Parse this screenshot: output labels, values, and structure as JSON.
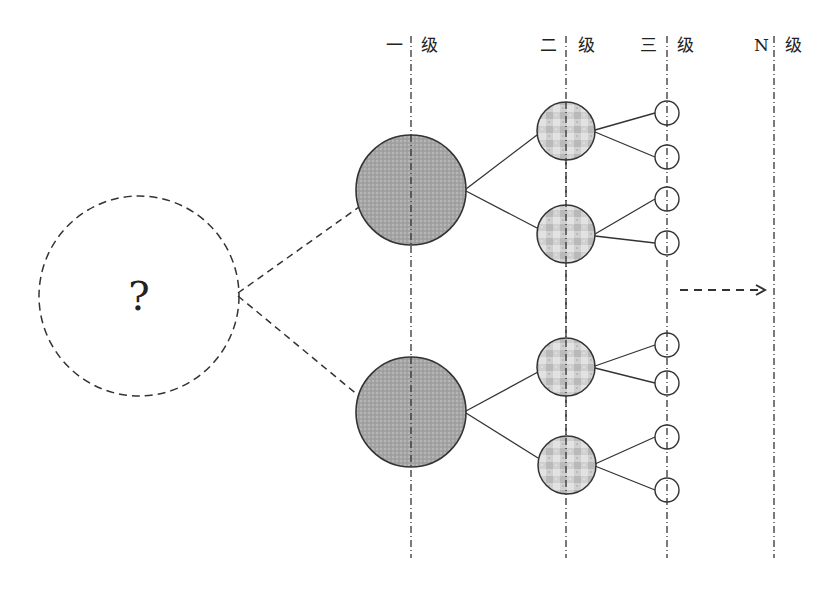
{
  "diagram": {
    "title": "",
    "level_labels": [
      {
        "prefix": "一",
        "suffix": "级",
        "x": 411
      },
      {
        "prefix": "二",
        "suffix": "级",
        "x": 566
      },
      {
        "prefix": "三",
        "suffix": "级",
        "x": 667
      },
      {
        "prefix": "N",
        "suffix": "级",
        "x": 774
      }
    ],
    "root": {
      "label": "?",
      "style": "dashed",
      "cx": 139,
      "cy": 296,
      "r": 100
    },
    "level1_nodes": [
      {
        "cx": 411,
        "cy": 190,
        "r": 55
      },
      {
        "cx": 411,
        "cy": 412,
        "r": 55
      }
    ],
    "level2_nodes": [
      {
        "cx": 566,
        "cy": 130,
        "r": 29
      },
      {
        "cx": 566,
        "cy": 234,
        "r": 29
      },
      {
        "cx": 566,
        "cy": 367,
        "r": 29
      },
      {
        "cx": 566,
        "cy": 464,
        "r": 29
      }
    ],
    "level3_nodes": [
      {
        "cx": 667,
        "cy": 113,
        "r": 12
      },
      {
        "cx": 667,
        "cy": 157,
        "r": 12
      },
      {
        "cx": 667,
        "cy": 199,
        "r": 12
      },
      {
        "cx": 667,
        "cy": 243,
        "r": 12
      },
      {
        "cx": 667,
        "cy": 345,
        "r": 12
      },
      {
        "cx": 667,
        "cy": 383,
        "r": 12
      },
      {
        "cx": 667,
        "cy": 437,
        "r": 12
      },
      {
        "cx": 667,
        "cy": 490,
        "r": 12
      }
    ],
    "continuation_arrow": {
      "direction": "right",
      "style": "dashed"
    },
    "colors": {
      "stroke": "#333333",
      "level1_fill": "#a8a8a8",
      "level2_fill": "#cfcfcf",
      "background": "#ffffff"
    }
  }
}
